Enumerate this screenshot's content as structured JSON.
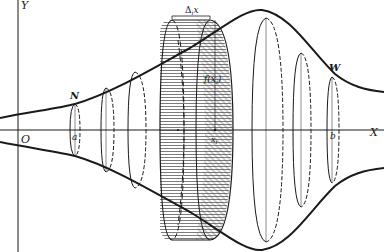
{
  "figure": {
    "type": "solid-of-revolution",
    "colors": {
      "ink": "#1a1a1a",
      "background": "#ffffff",
      "hatch": "#555555"
    }
  },
  "axes": {
    "y_label": "Y",
    "x_label": "X",
    "origin_label": "O"
  },
  "points": {
    "n_label": "N",
    "w_label": "W",
    "a_label": "a",
    "b_label": "b",
    "xi_label": "x",
    "xi_sub": "i",
    "fxi_label": "f(x",
    "fxi_sub": "i",
    "fxi_close": ")",
    "delta_label": "Δ",
    "delta_sub": "i",
    "delta_var": "x"
  }
}
